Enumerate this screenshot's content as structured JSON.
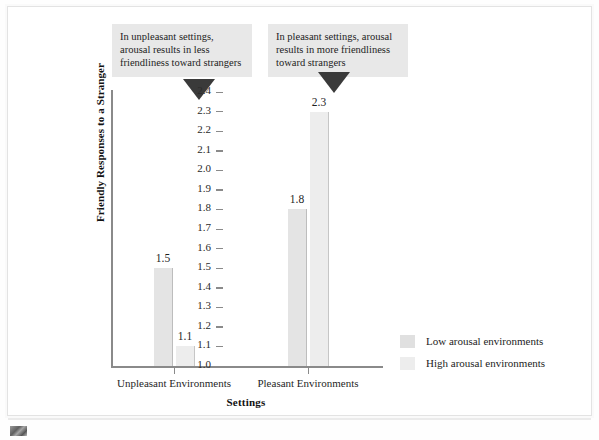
{
  "chart_data": {
    "type": "bar",
    "title": "",
    "xlabel": "Settings",
    "ylabel": "Friendly Responses to a Stranger",
    "ylim": [
      1.0,
      2.4
    ],
    "ytick_labels": [
      "2.4",
      "2.3",
      "2.2",
      "2.1",
      "2.0",
      "1.9",
      "1.8",
      "1.7",
      "1.6",
      "1.5",
      "1.4",
      "1.3",
      "1.2",
      "1.1",
      "1.0"
    ],
    "grid": false,
    "legend_position": "right",
    "categories": [
      "Unpleasant Environments",
      "Pleasant Environments"
    ],
    "series": [
      {
        "name": "Low arousal environments",
        "values": [
          1.5,
          1.8
        ]
      },
      {
        "name": "High arousal environments",
        "values": [
          1.1,
          2.3
        ]
      }
    ],
    "data_labels": [
      "1.5",
      "1.1",
      "1.8",
      "2.3"
    ],
    "annotations": [
      "In unpleasant settings, arousal results in less friendliness toward strangers",
      "In pleasant settings, arousal results in more friendliness toward strangers"
    ]
  },
  "callouts": [
    {
      "text": "In unpleasant settings, arousal results in less friendliness toward strangers"
    },
    {
      "text": "In pleasant settings, arousal results in more friendliness toward strangers"
    }
  ],
  "axes": {
    "y_title": "Friendly Responses to a Stranger",
    "x_title": "Settings",
    "y_ticks": [
      "2.4",
      "2.3",
      "2.2",
      "2.1",
      "2.0",
      "1.9",
      "1.8",
      "1.7",
      "1.6",
      "1.5",
      "1.4",
      "1.3",
      "1.2",
      "1.1",
      "1.0"
    ],
    "x_ticks": [
      "Unpleasant Environments",
      "Pleasant Environments"
    ]
  },
  "bars": [
    {
      "label": "1.5",
      "series": "low",
      "group": 0
    },
    {
      "label": "1.1",
      "series": "high",
      "group": 0
    },
    {
      "label": "1.8",
      "series": "low",
      "group": 1
    },
    {
      "label": "2.3",
      "series": "high",
      "group": 1
    }
  ],
  "legend": {
    "items": [
      {
        "label": "Low arousal environments",
        "swatch": "low"
      },
      {
        "label": "High arousal environments",
        "swatch": "high"
      }
    ]
  },
  "colors": {
    "bar_low": "#e4e4e4",
    "bar_high": "#ededed",
    "axis": "#8a8a8a",
    "callout_bg": "#e8e8e8",
    "arrow": "#3a3a3a"
  }
}
